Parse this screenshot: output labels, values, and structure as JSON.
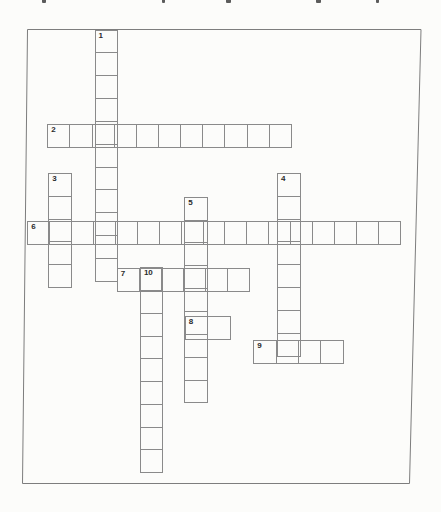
{
  "page": {
    "background": "#fcfcfa"
  },
  "top_edge_artifacts": {
    "description": "bottoms of cropped text glyphs from line above the scan crop",
    "color": "#3f3f3f",
    "marks": [
      {
        "x": 42,
        "w": 4
      },
      {
        "x": 162,
        "w": 3
      },
      {
        "x": 226,
        "w": 5
      },
      {
        "x": 316,
        "w": 5
      },
      {
        "x": 376,
        "w": 3
      }
    ]
  },
  "puzzle": {
    "grid_line_color": "#8a8a8a",
    "outer_border_color": "#7d7d7d",
    "number_color": "#2b2b2b",
    "outer_border": {
      "top_left": [
        27.5,
        29.5
      ],
      "top_right": [
        421,
        29.5
      ],
      "bottom_right": [
        409.5,
        483.5
      ],
      "bottom_left": [
        22.5,
        483.5
      ]
    },
    "words": [
      {
        "number": "1",
        "direction": "down",
        "length": 11,
        "x": 94.5,
        "y": 29.5,
        "cell_w": 23.5,
        "cell_h": 23.85
      },
      {
        "number": "2",
        "direction": "across",
        "length": 11,
        "x": 47.3,
        "y": 124.2,
        "cell_w": 23.15,
        "cell_h": 24.1
      },
      {
        "number": "3",
        "direction": "down",
        "length": 5,
        "x": 48.2,
        "y": 172.8,
        "cell_w": 23.6,
        "cell_h": 23.9
      },
      {
        "number": "4",
        "direction": "down",
        "length": 8,
        "x": 277.0,
        "y": 172.8,
        "cell_w": 23.8,
        "cell_h": 23.9
      },
      {
        "number": "5",
        "direction": "down",
        "length": 9,
        "x": 184.3,
        "y": 196.8,
        "cell_w": 23.5,
        "cell_h": 23.85
      },
      {
        "number": "6",
        "direction": "across",
        "length": 17,
        "x": 27.3,
        "y": 220.8,
        "cell_w": 22.92,
        "cell_h": 24.2
      },
      {
        "number": "7",
        "direction": "across",
        "length": 6,
        "x": 116.8,
        "y": 267.6,
        "cell_w": 23.05,
        "cell_h": 24.1
      },
      {
        "number": "8",
        "direction": "across",
        "length": 2,
        "x": 184.7,
        "y": 316.4,
        "cell_w": 23.8,
        "cell_h": 23.8
      },
      {
        "number": "9",
        "direction": "across",
        "length": 4,
        "x": 253.3,
        "y": 340.2,
        "cell_w": 23.35,
        "cell_h": 23.8
      },
      {
        "number": "10",
        "direction": "down",
        "length": 9,
        "x": 140.0,
        "y": 267.4,
        "cell_w": 23.3,
        "cell_h": 23.75
      }
    ]
  }
}
